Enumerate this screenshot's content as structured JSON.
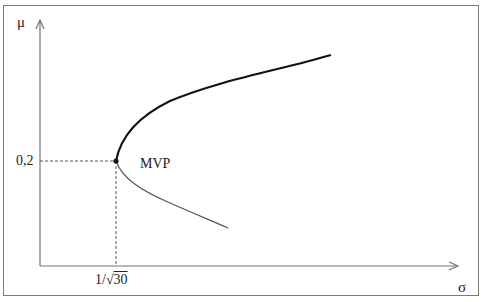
{
  "diagram": {
    "axes": {
      "y_label": "μ",
      "x_label": "σ"
    },
    "ticks": {
      "y_tick": "0,2",
      "x_tick_prefix": "1/√",
      "x_tick_radicand": "30"
    },
    "point": {
      "label": "MVP",
      "mu": 0.2,
      "sigma_expr": "1/√30"
    },
    "colors": {
      "frame": "#7a7a7a",
      "axis": "#777777",
      "upper_branch": "#111111",
      "lower_branch": "#555555",
      "guide": "#555555"
    }
  }
}
